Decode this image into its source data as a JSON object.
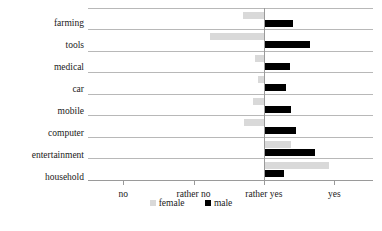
{
  "chart_data": {
    "type": "bar",
    "title": "",
    "subtitle": "",
    "xlabel": "",
    "ylabel": "",
    "orientation": "horizontal",
    "grid": true,
    "legend_position": "bottom",
    "baseline_category": "rather yes",
    "axis": {
      "tick_labels": [
        "no",
        "rather no",
        "rather yes",
        "yes"
      ],
      "tick_values": [
        1,
        2,
        3,
        4
      ],
      "xlim": [
        0.5,
        4.55
      ]
    },
    "categories": [
      "farming",
      "tools",
      "medical",
      "car",
      "mobile",
      "computer",
      "entertainment",
      "household"
    ],
    "series": [
      {
        "name": "female",
        "color": "#d9d9d9",
        "values": [
          2.7,
          2.23,
          2.87,
          2.92,
          2.85,
          2.71,
          3.39,
          3.92
        ]
      },
      {
        "name": "male",
        "color": "#000000",
        "values": [
          3.42,
          3.65,
          3.37,
          3.32,
          3.38,
          3.46,
          3.73,
          3.28
        ]
      }
    ]
  },
  "legend": {
    "items": [
      {
        "label": "female",
        "swatch": "female-swatch"
      },
      {
        "label": "male",
        "swatch": "male-swatch"
      }
    ]
  },
  "caption": {
    "text": ""
  }
}
